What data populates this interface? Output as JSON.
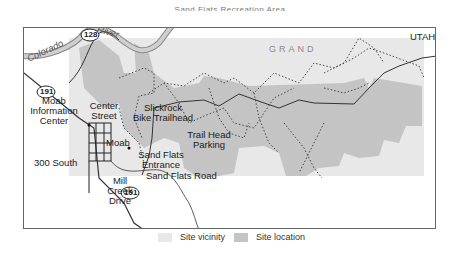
{
  "title": "Sand Flats Recreation Area",
  "map": {
    "state_label": "UTAH",
    "county_label": "GRAND",
    "river_label": "Colorado River",
    "river_label_part1": "Colorado",
    "river_label_part2": "River",
    "highways": [
      {
        "id": "128",
        "label": "128"
      },
      {
        "id": "191-north",
        "label": "191"
      },
      {
        "id": "191-south",
        "label": "191"
      }
    ],
    "places": {
      "moab": "Moab",
      "moab_info_center": [
        "Moab",
        "Information",
        "Center"
      ],
      "center_street": [
        "Center",
        "Street"
      ],
      "south_300": "300 South",
      "mill_creek_drive": [
        "Mill",
        "Creek",
        "Drive"
      ],
      "slickrock_trailhead": [
        "Slickrock",
        "Bike Trailhead"
      ],
      "trail_head_parking": [
        "Trail Head",
        "Parking"
      ],
      "sand_flats_entrance": [
        "Sand Flats",
        "Entrance"
      ],
      "sand_flats_road": "Sand Flats Road"
    },
    "colors": {
      "site_vicinity": "#e8e8e8",
      "site_location": "#c4c4c4",
      "river": "#bdbdbd",
      "road": "#333333",
      "trail": "#444444"
    }
  },
  "legend": {
    "items": [
      {
        "label": "Site vicinity",
        "color": "#e8e8e8"
      },
      {
        "label": "Site location",
        "color": "#c4c4c4"
      }
    ]
  }
}
